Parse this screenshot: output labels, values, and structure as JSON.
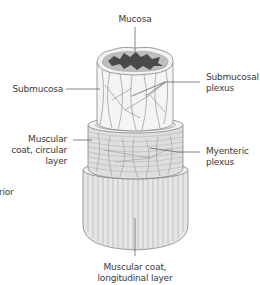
{
  "figure": {
    "labels": {
      "mucosa": "Mucosa",
      "submucosa": "Submucosa",
      "submucosal_plexus_1": "Submucosal",
      "submucosal_plexus_2": "plexus",
      "circular_1": "Muscular",
      "circular_2": "coat, circular",
      "circular_3": "layer",
      "myenteric_1": "Myenteric",
      "myenteric_2": "plexus",
      "longitudinal_1": "Muscular coat,",
      "longitudinal_2": "longitudinal layer",
      "cropped_left": "rior"
    },
    "colors": {
      "text": "#3a3a3a",
      "line": "#555555",
      "lumen": "#4a4a4a",
      "mucosa_ring": "#9a9a9a",
      "tissue": "#ededed",
      "muscle": "#dcdcdc"
    }
  }
}
